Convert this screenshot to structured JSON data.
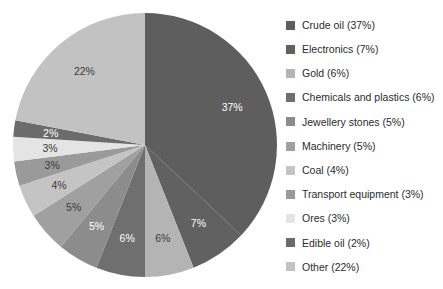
{
  "chart_data": {
    "type": "pie",
    "title": "",
    "subtitle": "",
    "xlabel": "",
    "ylabel": "",
    "grid": false,
    "legend_position": "right",
    "start_angle_deg": 0,
    "direction": "clockwise",
    "units": "percent",
    "total": 100,
    "categories": [
      "Crude oil",
      "Electronics",
      "Gold",
      "Chemicals and plastics",
      "Jewellery stones",
      "Machinery",
      "Coal",
      "Transport equipment",
      "Ores",
      "Edible oil",
      "Other"
    ],
    "values": [
      37,
      7,
      6,
      6,
      5,
      5,
      4,
      3,
      3,
      2,
      22
    ],
    "slice_labels": [
      "37%",
      "7%",
      "6%",
      "6%",
      "5%",
      "5%",
      "4%",
      "3%",
      "3%",
      "2%",
      "22%"
    ],
    "colors": [
      "#5e5e5e",
      "#616161",
      "#b4b4b4",
      "#6f6f6f",
      "#8c8c8c",
      "#a0a0a0",
      "#c4c4c4",
      "#9a9a9a",
      "#e4e4e4",
      "#6b6b6b",
      "#c2c2c2"
    ],
    "slice_label_colors": [
      "#ffffff",
      "#ffffff",
      "#3a3a3a",
      "#ffffff",
      "#ffffff",
      "#3a3a3a",
      "#3a3a3a",
      "#3a3a3a",
      "#3a3a3a",
      "#ffffff",
      "#3a3a3a"
    ]
  },
  "legend": {
    "items": [
      {
        "label": "Crude oil (37%)",
        "color": "#5e5e5e"
      },
      {
        "label": "Electronics (7%)",
        "color": "#616161"
      },
      {
        "label": "Gold (6%)",
        "color": "#b4b4b4"
      },
      {
        "label": "Chemicals and plastics (6%)",
        "color": "#6f6f6f"
      },
      {
        "label": "Jewellery stones (5%)",
        "color": "#8c8c8c"
      },
      {
        "label": "Machinery (5%)",
        "color": "#a0a0a0"
      },
      {
        "label": "Coal (4%)",
        "color": "#c4c4c4"
      },
      {
        "label": "Transport equipment (3%)",
        "color": "#9a9a9a"
      },
      {
        "label": "Ores (3%)",
        "color": "#e4e4e4"
      },
      {
        "label": "Edible oil (2%)",
        "color": "#6b6b6b"
      },
      {
        "label": "Other (22%)",
        "color": "#c2c2c2"
      }
    ]
  },
  "geometry": {
    "center_x": 145,
    "center_y": 145,
    "radius": 132,
    "label_radius_ratio": 0.72
  }
}
